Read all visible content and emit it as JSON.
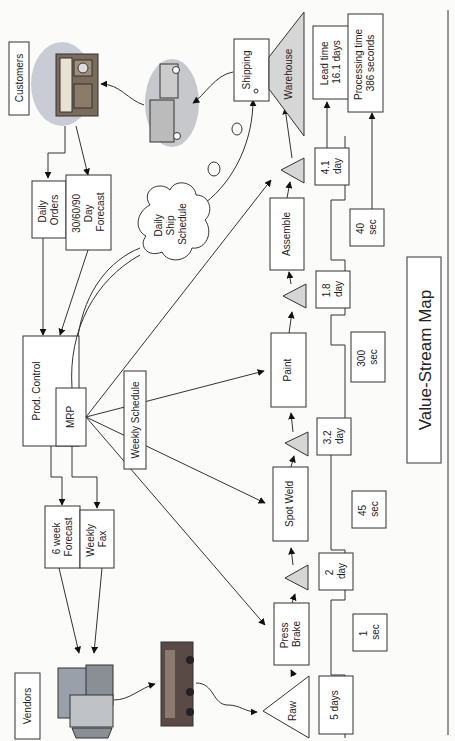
{
  "title": "Value-Stream Map",
  "entities": {
    "customers": "Customers",
    "vendors": "Vendors",
    "prod_control": "Prod. Control",
    "mrp": "MRP",
    "weekly_schedule": "Weekly Schedule",
    "daily_ship_schedule": [
      "Daily",
      "Ship",
      "Schedule"
    ]
  },
  "info_flows": {
    "daily_orders": [
      "Daily",
      "Orders"
    ],
    "forecast_30_60_90": [
      "30/60/90",
      "Day",
      "Forecast"
    ],
    "six_week_forecast": [
      "6 week",
      "Forecast"
    ],
    "weekly_fax": [
      "Weekly",
      "Fax"
    ]
  },
  "processes": [
    {
      "name": [
        "Press",
        "Brake"
      ]
    },
    {
      "name": [
        "Spot Weld"
      ]
    },
    {
      "name": [
        "Paint"
      ]
    },
    {
      "name": [
        "Assemble"
      ]
    },
    {
      "name": [
        "Shipping"
      ]
    }
  ],
  "inventory": {
    "raw": "Raw",
    "warehouse": "Warehouse"
  },
  "timeline": {
    "wait_times": [
      [
        "5 days"
      ],
      [
        "2",
        "day"
      ],
      [
        "3.2",
        "day"
      ],
      [
        "1.8",
        "day"
      ],
      [
        "4.1",
        "day"
      ]
    ],
    "process_times": [
      [
        "1",
        "sec"
      ],
      [
        "45",
        "sec"
      ],
      [
        "300",
        "sec"
      ],
      [
        "40",
        "sec"
      ]
    ],
    "lead_time": [
      "Lead time",
      "16.1 days"
    ],
    "processing_time": [
      "Processing time",
      "386 seconds"
    ]
  },
  "colors": {
    "line": "#333333",
    "inventory_fill": "#d6d6d6",
    "background": "#fbfbfa"
  }
}
